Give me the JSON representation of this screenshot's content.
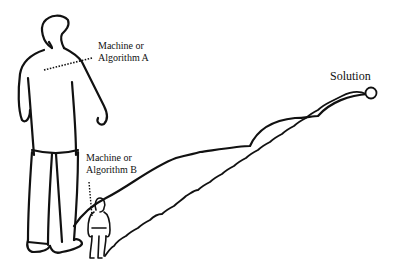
{
  "diagram": {
    "labels": {
      "machine_a_line1": "Machine or",
      "machine_a_line2": "Algorithm A",
      "machine_b_line1": "Machine or",
      "machine_b_line2": "Algorithm B",
      "solution": "Solution"
    },
    "colors": {
      "ink": "#111111",
      "background": "#ffffff"
    }
  }
}
